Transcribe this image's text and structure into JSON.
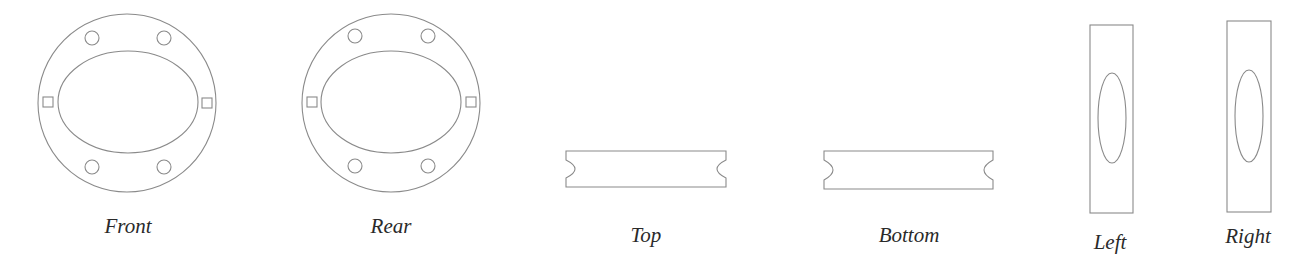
{
  "diagram": {
    "type": "orthographic-projection",
    "line_color": "#8a8a8a",
    "label_color": "#2a2a2a",
    "views": [
      {
        "id": "front",
        "label": "Front",
        "shape": "annular-flange",
        "outer_circle": {
          "cx": 127,
          "cy": 103,
          "r": 89
        },
        "inner_ellipse": {
          "cx": 128,
          "cy": 102,
          "rx": 70,
          "ry": 51
        },
        "bolt_holes": [
          {
            "cx": 92,
            "cy": 38,
            "r": 7
          },
          {
            "cx": 164,
            "cy": 38,
            "r": 7
          },
          {
            "cx": 92,
            "cy": 167,
            "r": 7
          },
          {
            "cx": 164,
            "cy": 167,
            "r": 7
          }
        ],
        "square_slots": [
          {
            "x": 43,
            "y": 97,
            "w": 10,
            "h": 10
          },
          {
            "x": 202,
            "y": 98,
            "w": 10,
            "h": 10
          }
        ],
        "label_pos": {
          "x": 128,
          "y": 216
        }
      },
      {
        "id": "rear",
        "label": "Rear",
        "shape": "annular-flange",
        "outer_circle": {
          "cx": 391,
          "cy": 103,
          "r": 89
        },
        "inner_ellipse": {
          "cx": 391,
          "cy": 102,
          "rx": 70,
          "ry": 51
        },
        "bolt_holes": [
          {
            "cx": 355,
            "cy": 36,
            "r": 7
          },
          {
            "cx": 428,
            "cy": 36,
            "r": 7
          },
          {
            "cx": 355,
            "cy": 166,
            "r": 7
          },
          {
            "cx": 428,
            "cy": 166,
            "r": 7
          }
        ],
        "square_slots": [
          {
            "x": 307,
            "y": 97,
            "w": 10,
            "h": 10
          },
          {
            "x": 466,
            "y": 97,
            "w": 10,
            "h": 10
          }
        ],
        "label_pos": {
          "x": 391,
          "y": 216
        }
      },
      {
        "id": "top",
        "label": "Top",
        "shape": "notched-bar",
        "bar": {
          "x1": 566,
          "x2": 726,
          "y1": 151,
          "y2": 187,
          "notch_depth": 9,
          "notch_top": 160,
          "notch_bottom": 178
        },
        "label_pos": {
          "x": 646,
          "y": 225
        }
      },
      {
        "id": "bottom",
        "label": "Bottom",
        "shape": "notched-bar",
        "bar": {
          "x1": 824,
          "x2": 993,
          "y1": 151,
          "y2": 189,
          "notch_depth": 9,
          "notch_top": 160,
          "notch_bottom": 180
        },
        "label_pos": {
          "x": 909,
          "y": 225
        }
      },
      {
        "id": "left",
        "label": "Left",
        "shape": "rect-with-ellipse",
        "rect": {
          "x": 1090,
          "y": 25,
          "w": 43,
          "h": 188
        },
        "ellipse": {
          "cx": 1112,
          "cy": 118,
          "rx": 14,
          "ry": 45
        },
        "label_pos": {
          "x": 1110,
          "y": 232
        }
      },
      {
        "id": "right",
        "label": "Right",
        "shape": "rect-with-ellipse",
        "rect": {
          "x": 1227,
          "y": 21,
          "w": 44,
          "h": 191
        },
        "ellipse": {
          "cx": 1249,
          "cy": 116,
          "rx": 14,
          "ry": 46
        },
        "label_pos": {
          "x": 1248,
          "y": 226
        }
      }
    ]
  }
}
